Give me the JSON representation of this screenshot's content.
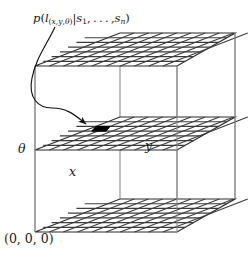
{
  "figure": {
    "name": "pose-belief-grid-3d-diagram",
    "background_color": "#ffffff",
    "ink_color": "#1a1a1a",
    "grid_color": "#4a4a4a",
    "highlight_color": "#000000"
  },
  "labels": {
    "formula": {
      "p": "p",
      "open": "(",
      "l": "l",
      "sub_open": "(",
      "sub_x": "x",
      "sub_comma1": ",",
      "sub_y": "y",
      "sub_comma2": ",",
      "sub_theta": "θ",
      "sub_close": ")",
      "bar": "|",
      "s1": "s",
      "s1_index": "1",
      "ellipsis": ", . . . ,",
      "sn": "s",
      "sn_index": "n",
      "close": ")",
      "plain_text": "p(l(x,y,θ)|s1,...,sn)"
    },
    "origin": "(0, 0, 0)",
    "axis_theta": "θ",
    "axis_x": "x",
    "axis_y": "y"
  },
  "geometry": {
    "box": {
      "front_left_x": 35,
      "front_right_x": 177,
      "back_left_x": 120,
      "back_right_x": 235,
      "top_front_y": 66,
      "top_back_y": 33,
      "bottom_front_y": 232,
      "bottom_back_y": 199
    },
    "planes": [
      {
        "name": "top-plane",
        "front_left_y": 66,
        "cells_u": 10,
        "cells_v": 7
      },
      {
        "name": "middle-plane",
        "front_left_y": 150,
        "cells_u": 10,
        "cells_v": 7
      },
      {
        "name": "bottom-plane",
        "front_left_y": 232,
        "cells_u": 10,
        "cells_v": 7
      }
    ],
    "highlight_cell": {
      "plane": "middle-plane",
      "u": 3,
      "v": 4
    }
  }
}
